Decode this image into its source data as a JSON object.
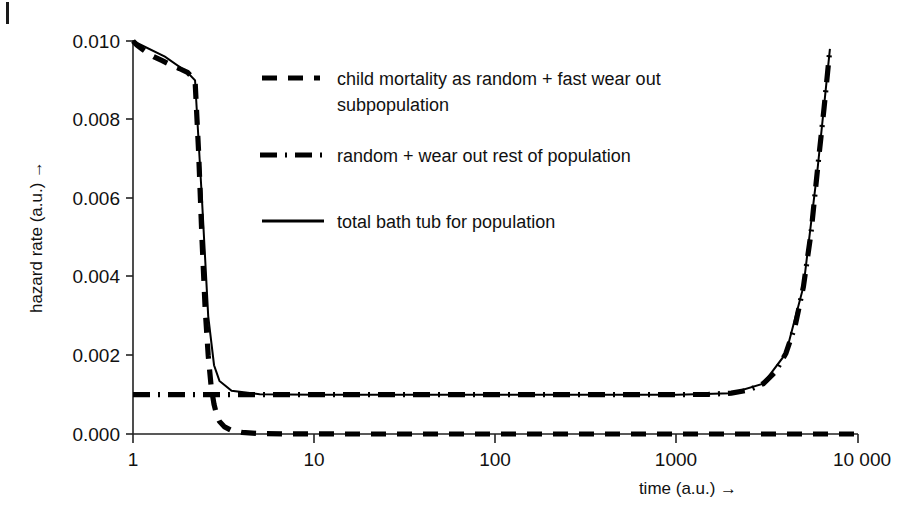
{
  "figure": {
    "background": "#ffffff",
    "ink_color": "#000000"
  },
  "chart_data": {
    "type": "line",
    "title": "",
    "xlabel": "time (a.u.) →",
    "ylabel": "hazard rate (a.u.) →",
    "xscale": "log",
    "yscale": "linear",
    "xlim": [
      1,
      10000
    ],
    "ylim": [
      0.0,
      0.01
    ],
    "grid": false,
    "legend_position": "upper-center-inside",
    "xticks": [
      1,
      10,
      100,
      1000,
      10000
    ],
    "xticklabels": [
      "1",
      "10",
      "100",
      "1000",
      "10 000"
    ],
    "yticks": [
      0.0,
      0.002,
      0.004,
      0.006,
      0.008,
      0.01
    ],
    "yticklabels": [
      "0.000",
      "0.002",
      "0.004",
      "0.006",
      "0.008",
      "0.010"
    ],
    "series": [
      {
        "name": "child mortality as random + fast wear out subpopulation",
        "style": "dashed",
        "x": [
          1.0,
          1.05,
          1.12,
          1.2,
          1.3,
          1.45,
          1.6,
          1.8,
          2.0,
          2.1,
          2.2,
          2.3,
          2.4,
          2.5,
          2.6,
          2.7,
          2.8,
          2.9,
          3.0,
          3.2,
          3.5,
          4.0,
          5.0,
          7.0,
          10.0,
          20.0,
          50.0,
          100.0,
          300.0,
          1000.0,
          3000.0,
          10000.0
        ],
        "y": [
          0.01,
          0.0099,
          0.0098,
          0.0097,
          0.0096,
          0.0095,
          0.0094,
          0.0093,
          0.0092,
          0.0091,
          0.009,
          0.0072,
          0.005,
          0.0032,
          0.002,
          0.0012,
          0.00075,
          0.00048,
          0.00032,
          0.00018,
          9e-05,
          4e-05,
          1e-05,
          3e-06,
          1e-06,
          0.0,
          0.0,
          0.0,
          0.0,
          0.0,
          0.0,
          0.0
        ]
      },
      {
        "name": "random + wear out rest of population",
        "style": "dash-dot",
        "x": [
          1.0,
          2.0,
          5.0,
          10.0,
          50.0,
          100.0,
          500.0,
          1000.0,
          1500.0,
          2000.0,
          2500.0,
          3000.0,
          3500.0,
          4000.0,
          4500.0,
          5000.0,
          5500.0,
          6000.0,
          6500.0,
          7000.0
        ],
        "y": [
          0.001,
          0.001,
          0.001,
          0.001,
          0.001,
          0.001,
          0.001,
          0.001,
          0.00101,
          0.00104,
          0.00112,
          0.00128,
          0.00158,
          0.00205,
          0.00275,
          0.00375,
          0.0051,
          0.0068,
          0.0083,
          0.0098
        ]
      },
      {
        "name": "total bath tub for population",
        "style": "solid",
        "x": [
          1.0,
          1.5,
          2.0,
          2.2,
          2.4,
          2.6,
          2.8,
          3.0,
          3.5,
          5.0,
          10.0,
          100.0,
          1000.0,
          2000.0,
          3000.0,
          4000.0,
          5000.0,
          6000.0,
          7000.0
        ],
        "y": [
          0.01,
          0.0096,
          0.0092,
          0.009,
          0.006,
          0.003,
          0.00175,
          0.00135,
          0.0011,
          0.00101,
          0.001,
          0.001,
          0.001,
          0.00104,
          0.00128,
          0.00205,
          0.00375,
          0.0068,
          0.0098
        ]
      }
    ],
    "annotations": {
      "description": "Bathtub-shaped hazard rate curve: infant/child mortality decreasing region, constant random-failure plateau at 0.001, and wear-out increase after ~2000 a.u."
    }
  },
  "legend": {
    "entries": [
      {
        "key": "dashed",
        "label_line1": "child mortality as random + fast wear out",
        "label_line2": "subpopulation"
      },
      {
        "key": "dash-dot",
        "label_line1": "random + wear out rest of population",
        "label_line2": ""
      },
      {
        "key": "solid",
        "label_line1": "total bath tub for population",
        "label_line2": ""
      }
    ]
  }
}
